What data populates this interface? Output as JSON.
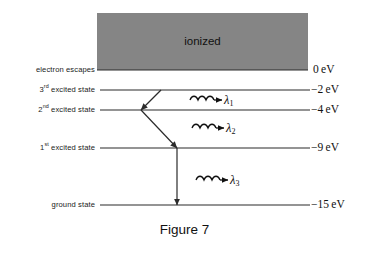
{
  "figure": {
    "caption": "Figure 7",
    "caption_x": 0,
    "caption_y": 222
  },
  "ionized_band": {
    "label": "ionized",
    "fill": "#858585",
    "x": 97,
    "y": 13,
    "width": 211,
    "height": 57,
    "text_x": 97,
    "text_y": 35
  },
  "levels": [
    {
      "name": "electron-escapes",
      "label": "electron escapes",
      "label_html": "electron escapes",
      "energy": "0 eV",
      "energy_html": "0 eV",
      "y": 70,
      "x_start": 97,
      "x_end": 308,
      "label_right": 95,
      "label_y": 65,
      "energy_x": 313,
      "energy_y": 63
    },
    {
      "name": "third-excited-state",
      "label": "3rd excited state",
      "label_html": "3<sup>rd</sup> excited  state",
      "energy": "-2 eV",
      "energy_html": "−2 eV",
      "y": 90,
      "x_start": 100,
      "x_end": 310,
      "label_right": 95,
      "label_y": 85,
      "energy_x": 311,
      "energy_y": 83
    },
    {
      "name": "second-excited-state",
      "label": "2nd excited state",
      "label_html": "2<sup>nd</sup> excited  state",
      "energy": "-4 eV",
      "energy_html": "−4 eV",
      "y": 110,
      "x_start": 100,
      "x_end": 310,
      "label_right": 95,
      "label_y": 105,
      "energy_x": 311,
      "energy_y": 103
    },
    {
      "name": "first-excited-state",
      "label": "1st excited state",
      "label_html": "1<sup>st</sup> excited  state",
      "energy": "-9 eV",
      "energy_html": "−9 eV",
      "y": 148,
      "x_start": 100,
      "x_end": 310,
      "label_right": 95,
      "label_y": 143,
      "energy_x": 311,
      "energy_y": 141
    },
    {
      "name": "ground-state",
      "label": "ground state",
      "label_html": "ground state",
      "energy": "-15 eV",
      "energy_html": "−15 eV",
      "y": 205,
      "x_start": 100,
      "x_end": 310,
      "label_right": 95,
      "label_y": 200,
      "energy_x": 311,
      "energy_y": 198
    }
  ],
  "transitions": [
    {
      "name": "transition-lambda-1",
      "from_level": "3rd excited state",
      "to_level": "2nd excited state",
      "x1": 161,
      "y1": 90,
      "x2": 141,
      "y2": 110,
      "photon_label": "λ",
      "photon_sub": "1",
      "wave_x": 190,
      "wave_y": 100,
      "label_x": 224,
      "label_y": 93
    },
    {
      "name": "transition-lambda-2",
      "from_level": "2nd excited state",
      "to_level": "1st excited state",
      "x1": 141,
      "y1": 110,
      "x2": 177,
      "y2": 148,
      "photon_label": "λ",
      "photon_sub": "2",
      "wave_x": 192,
      "wave_y": 128,
      "label_x": 226,
      "label_y": 121
    },
    {
      "name": "transition-lambda-3",
      "from_level": "1st excited state",
      "to_level": "ground state",
      "x1": 177,
      "y1": 148,
      "x2": 177,
      "y2": 205,
      "photon_label": "λ",
      "photon_sub": "3",
      "wave_x": 196,
      "wave_y": 180,
      "label_x": 230,
      "label_y": 173
    }
  ],
  "colors": {
    "line": "#2b2b2b",
    "text": "#111111",
    "band": "#858585",
    "background": "#ffffff"
  }
}
